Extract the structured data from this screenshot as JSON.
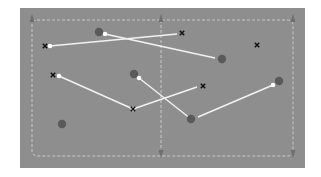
{
  "diagram": {
    "type": "tactics-board",
    "field": {
      "x": 20,
      "y": 8,
      "width": 285,
      "height": 160,
      "background": "#8e8e8e",
      "boundary_color": "#c8c8c8",
      "inner_margin": 12,
      "center_line_x": 161
    },
    "colors": {
      "circle_player": "#5a5a5a",
      "x_marker": "#111111",
      "line": "#f2f2f2",
      "endpoint": "#ffffff",
      "arrow": "#6e6e6e"
    },
    "circles": [
      {
        "id": "c1",
        "x": 99,
        "y": 32
      },
      {
        "id": "c2",
        "x": 222,
        "y": 59
      },
      {
        "id": "c3",
        "x": 134,
        "y": 74
      },
      {
        "id": "c4",
        "x": 279,
        "y": 81
      },
      {
        "id": "c5",
        "x": 191,
        "y": 119
      },
      {
        "id": "c6",
        "x": 62,
        "y": 124
      }
    ],
    "crosses": [
      {
        "id": "x1",
        "x": 45,
        "y": 46
      },
      {
        "id": "x2",
        "x": 182,
        "y": 33
      },
      {
        "id": "x3",
        "x": 257,
        "y": 45
      },
      {
        "id": "x4",
        "x": 53,
        "y": 75
      },
      {
        "id": "x5",
        "x": 203,
        "y": 86
      },
      {
        "id": "x6",
        "x": 133,
        "y": 109
      }
    ],
    "lines": [
      {
        "from": [
          50,
          46
        ],
        "to": [
          177,
          34
        ]
      },
      {
        "from": [
          105,
          34
        ],
        "to": [
          215,
          58
        ]
      },
      {
        "from": [
          59,
          76
        ],
        "to": [
          133,
          109
        ]
      },
      {
        "from": [
          133,
          109
        ],
        "to": [
          197,
          87
        ]
      },
      {
        "from": [
          139,
          78
        ],
        "to": [
          191,
          119
        ]
      },
      {
        "from": [
          273,
          85
        ],
        "to": [
          198,
          117
        ]
      }
    ],
    "arrows": [
      {
        "x": 32,
        "y": 16,
        "dir": "up"
      },
      {
        "x": 161,
        "y": 16,
        "dir": "up"
      },
      {
        "x": 293,
        "y": 16,
        "dir": "up"
      },
      {
        "x": 161,
        "y": 156,
        "dir": "down"
      },
      {
        "x": 293,
        "y": 156,
        "dir": "down"
      }
    ]
  }
}
